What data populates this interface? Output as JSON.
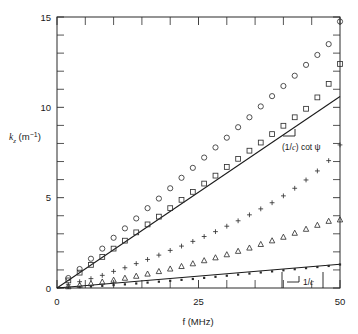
{
  "chart_data": {
    "type": "scatter",
    "title": "",
    "xlabel": "f (MHz)",
    "ylabel": "k_z (m^-1)",
    "ylabel_base": "k",
    "ylabel_sub": "z",
    "ylabel_unit_open": " (m",
    "ylabel_unit_exp": "−1",
    "ylabel_unit_close": ")",
    "xlim": [
      0,
      50
    ],
    "ylim": [
      0,
      15
    ],
    "xticks": [
      0,
      25,
      50
    ],
    "xtick_labels": [
      "0",
      "25",
      "50"
    ],
    "xticks_minor": [
      5,
      10,
      15,
      20,
      30,
      35,
      40,
      45
    ],
    "yticks": [
      0,
      5,
      10,
      15
    ],
    "ytick_labels": [
      "0",
      "5",
      "10",
      "15"
    ],
    "yticks_minor": [
      1,
      2,
      3,
      4,
      6,
      7,
      8,
      9,
      11,
      12,
      13,
      14
    ],
    "grid": false,
    "legend": "none",
    "series": [
      {
        "name": "circles",
        "marker": "open-circle",
        "x": [
          2,
          4,
          6,
          8,
          10,
          12,
          14,
          16,
          18,
          20,
          22,
          24,
          26,
          28,
          30,
          32,
          34,
          36,
          38,
          40,
          42,
          44,
          46,
          48,
          50
        ],
        "y": [
          0.55,
          1.05,
          1.62,
          2.18,
          2.78,
          3.3,
          3.85,
          4.42,
          4.95,
          5.52,
          6.1,
          6.65,
          7.22,
          7.78,
          8.32,
          8.9,
          9.45,
          10.05,
          10.62,
          11.18,
          11.75,
          12.35,
          12.9,
          13.5,
          14.75
        ]
      },
      {
        "name": "squares",
        "marker": "open-square",
        "x": [
          2,
          4,
          6,
          8,
          10,
          12,
          14,
          16,
          18,
          20,
          22,
          24,
          26,
          28,
          30,
          32,
          34,
          36,
          38,
          40,
          42,
          44,
          46,
          48,
          50
        ],
        "y": [
          0.42,
          0.85,
          1.28,
          1.72,
          2.18,
          2.62,
          3.08,
          3.52,
          3.95,
          4.42,
          4.88,
          5.32,
          5.78,
          6.22,
          6.7,
          7.15,
          7.6,
          8.05,
          8.52,
          8.98,
          9.45,
          9.92,
          10.55,
          11.3,
          12.4
        ]
      },
      {
        "name": "plus",
        "marker": "plus",
        "x": [
          2,
          4,
          6,
          8,
          10,
          12,
          14,
          16,
          18,
          20,
          22,
          24,
          26,
          28,
          30,
          32,
          34,
          36,
          38,
          40,
          42,
          44,
          46,
          48,
          50
        ],
        "y": [
          0.18,
          0.35,
          0.52,
          0.7,
          0.92,
          1.12,
          1.35,
          1.58,
          1.82,
          2.08,
          2.32,
          2.58,
          2.85,
          3.12,
          3.42,
          3.72,
          4.05,
          4.38,
          4.72,
          5.1,
          5.52,
          5.98,
          6.48,
          7.05,
          7.92
        ]
      },
      {
        "name": "triangles",
        "marker": "open-triangle",
        "x": [
          2,
          4,
          6,
          8,
          10,
          12,
          14,
          16,
          18,
          20,
          22,
          24,
          26,
          28,
          30,
          32,
          34,
          36,
          38,
          40,
          42,
          44,
          46,
          48,
          50
        ],
        "y": [
          0.08,
          0.16,
          0.25,
          0.34,
          0.44,
          0.55,
          0.66,
          0.78,
          0.92,
          1.06,
          1.2,
          1.35,
          1.52,
          1.68,
          1.85,
          2.04,
          2.22,
          2.42,
          2.62,
          2.82,
          3.04,
          3.26,
          3.48,
          3.7,
          3.78
        ]
      },
      {
        "name": "dots",
        "marker": "small-square",
        "x": [
          2,
          4,
          6,
          8,
          10,
          12,
          14,
          16,
          18,
          20,
          22,
          24,
          26,
          28,
          30,
          32,
          34,
          36,
          38,
          40,
          42,
          44,
          46,
          48,
          50
        ],
        "y": [
          0.02,
          0.05,
          0.08,
          0.12,
          0.16,
          0.2,
          0.25,
          0.3,
          0.35,
          0.4,
          0.45,
          0.5,
          0.56,
          0.62,
          0.68,
          0.74,
          0.8,
          0.86,
          0.92,
          0.98,
          1.04,
          1.1,
          1.16,
          1.22,
          1.3
        ]
      }
    ],
    "reference_lines": [
      {
        "name": "cot-psi-line",
        "label": "(1/c) cot ψ",
        "label_prefix": "(1/",
        "label_italic": "c",
        "label_suffix": ") cot ψ",
        "x0": 0,
        "y0": 0,
        "x1": 50,
        "y1": 10.6
      },
      {
        "name": "one-over-c-line",
        "label": "1/c",
        "label_prefix": "1/",
        "label_italic": "c",
        "label_suffix": "",
        "x0": 0,
        "y0": 0,
        "x1": 50,
        "y1": 1.32
      }
    ]
  }
}
